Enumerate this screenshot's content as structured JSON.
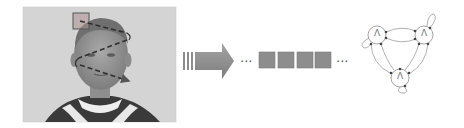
{
  "figure": {
    "panels": [
      {
        "name": "face-photo-with-scanpath",
        "description": "grayscale photo of a child's face with a dashed zig-zag scan path and a square window at top-left"
      },
      {
        "name": "transform-arrow"
      },
      {
        "name": "observation-sequence",
        "squares": 4
      },
      {
        "name": "state-graph",
        "nodes": 3
      }
    ],
    "sequence": {
      "leading_ellipsis": "...",
      "trailing_ellipsis": "..."
    },
    "graph": {
      "node_labels": [
        "Λ",
        "Λ",
        "Λ"
      ]
    },
    "colors": {
      "photo_bg": "#d6d6d6",
      "square_fill": "#8a8a8a",
      "arrow_fill": "#8c8c8c",
      "node_stroke": "#9a9a9a",
      "edge_stroke": "#b0b0b0",
      "scanpath": "#333333"
    }
  }
}
